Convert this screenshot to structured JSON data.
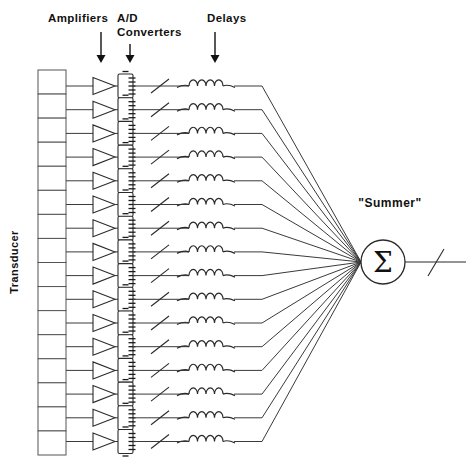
{
  "diagram": {
    "background_color": "#ffffff",
    "line_color": "#2a2a2a",
    "text_color": "#111111",
    "channel_count": 16,
    "column_headers": [
      {
        "id": "amplifiers",
        "label": "Amplifiers",
        "label_line2": "",
        "x": 97,
        "y": 18,
        "arrow_x": 101,
        "arrow_top": 32,
        "arrow_bottom": 63
      },
      {
        "id": "ad-converters",
        "label": "A/D",
        "label_line2": "Converters",
        "x": 117,
        "y": 18,
        "arrow_x": 130,
        "arrow_top": 44,
        "arrow_bottom": 63
      },
      {
        "id": "delays",
        "label": "Delays",
        "label_line2": "",
        "x": 207,
        "y": 18,
        "arrow_x": 215,
        "arrow_top": 32,
        "arrow_bottom": 63
      }
    ],
    "transducer": {
      "label": "Transducer",
      "label_x": 18,
      "label_y": 262,
      "rotation": -90,
      "column_x": 38,
      "column_y": 70,
      "column_width": 28,
      "column_height": 385,
      "cell_count": 16
    },
    "summer": {
      "label": "\"Summer\"",
      "label_x": 390,
      "label_y": 207,
      "symbol": "Σ",
      "center_x": 383,
      "center_y": 262,
      "radius": 22,
      "output_line_x1": 405,
      "output_line_x2": 466,
      "output_slash": true
    },
    "channel_geometry": {
      "first_row_y": 86,
      "row_spacing": 23.7,
      "transducer_out_x": 66,
      "amp_x": 93,
      "amp_width": 22,
      "amp_height": 17,
      "adc_x": 118,
      "adc_width": 15,
      "adc_height": 24,
      "slash_x": 160,
      "coil_x": 189,
      "coil_width": 34,
      "bend_x": 262,
      "converge_x": 361,
      "converge_y": 262
    },
    "symbols": {
      "amplifier": "triangle-amplifier",
      "converter": "ad-converter-block",
      "delay": "inductor-coil",
      "slash": "diagonal-slash-marker",
      "summer": "sigma-circle"
    }
  }
}
